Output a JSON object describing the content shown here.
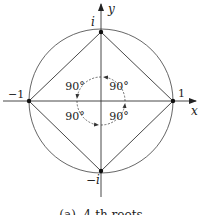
{
  "diagram": {
    "caption": "(a)  4-th roots",
    "axes": {
      "x_label": "x",
      "y_label": "y"
    },
    "points": [
      {
        "name": "one",
        "label": "1"
      },
      {
        "name": "i",
        "label": "i"
      },
      {
        "name": "minus-one",
        "label": "−1"
      },
      {
        "name": "minus-i",
        "label": "−i"
      }
    ],
    "angles": [
      {
        "quadrant": "upper-left",
        "label": "90°"
      },
      {
        "quadrant": "upper-right",
        "label": "90°"
      },
      {
        "quadrant": "lower-left",
        "label": "90°"
      },
      {
        "quadrant": "lower-right",
        "label": "90°"
      }
    ],
    "colors": {
      "stroke": "#333333",
      "circle": "#555555",
      "background": "#ffffff"
    }
  }
}
